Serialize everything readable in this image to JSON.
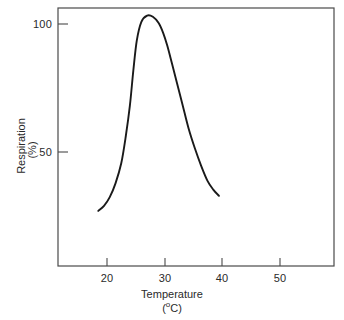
{
  "chart_data": {
    "type": "line",
    "title": "",
    "xlabel": "Temperature",
    "xunit": "(ºC)",
    "ylabel": "Respiration",
    "yunit": "(%)",
    "xlim": [
      12.5,
      60.5
    ],
    "ylim": [
      0,
      103
    ],
    "grid": false,
    "legend": null,
    "xticks": [
      20,
      30,
      40,
      50
    ],
    "xticklabels": [
      "20",
      "30",
      "40",
      "50"
    ],
    "yticks": [
      50,
      100
    ],
    "yticklabels": [
      "50",
      "100"
    ],
    "series": [
      {
        "name": "Respiration rate",
        "x": [
          19.5,
          20.5,
          21.5,
          22.5,
          23.5,
          24.3,
          25.0,
          25.6,
          26.2,
          27.0,
          28.0,
          29.0,
          30.0,
          30.8,
          31.5,
          32.3,
          33.2,
          34.2,
          35.2,
          36.3,
          37.4,
          38.5,
          39.5,
          40.5
        ],
        "y": [
          22.0,
          24.0,
          27.5,
          33.0,
          41.0,
          52.0,
          64.0,
          78.0,
          90.0,
          97.5,
          100.0,
          99.5,
          97.0,
          93.0,
          88.0,
          81.0,
          73.0,
          64.0,
          55.0,
          47.0,
          40.0,
          34.0,
          30.5,
          28.0
        ]
      }
    ],
    "colors": {
      "line": "#1a1a1a",
      "axis": "#4a4a4a",
      "background": "#ffffff"
    },
    "plot_box": {
      "left": 58,
      "right": 334,
      "top": 8,
      "bottom": 266
    }
  }
}
